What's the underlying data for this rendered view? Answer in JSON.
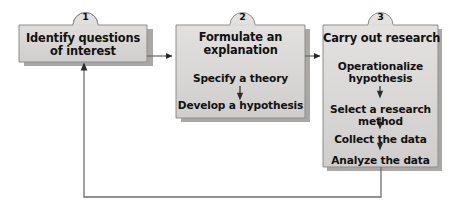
{
  "diagram": {
    "type": "flowchart",
    "orientation": "left-to-right with feedback loop",
    "colors": {
      "box_fill": "#d5d4d2",
      "box_fill_light": "#e2e1df",
      "box_border": "#8c8c8c",
      "shadow": "#a9a8a6",
      "connector": "#6f6f6f",
      "text": "#111111",
      "background": "#ffffff"
    },
    "boxes": [
      {
        "number": "1",
        "heading_lines": [
          "Identify questions",
          "of interest"
        ],
        "steps": []
      },
      {
        "number": "2",
        "heading_lines": [
          "Formulate an",
          "explanation"
        ],
        "steps": [
          {
            "lines": [
              "Specify a theory"
            ]
          },
          {
            "lines": [
              "Develop a hypothesis"
            ]
          }
        ]
      },
      {
        "number": "3",
        "heading_lines": [
          "Carry out research"
        ],
        "steps": [
          {
            "lines": [
              "Operationalize",
              "hypothesis"
            ]
          },
          {
            "lines": [
              "Select a research",
              "method"
            ]
          },
          {
            "lines": [
              "Collect the data"
            ]
          },
          {
            "lines": [
              "Analyze the data"
            ]
          }
        ]
      }
    ],
    "connectors": [
      {
        "name": "box1-to-box2",
        "kind": "arrow-right"
      },
      {
        "name": "box2-to-box3",
        "kind": "arrow-right"
      },
      {
        "name": "box3-to-box1-feedback",
        "kind": "arrow-loop-up"
      },
      {
        "name": "box2-internal-step-arrow",
        "kind": "arrow-down"
      },
      {
        "name": "box3-internal-step-arrow-1",
        "kind": "arrow-down"
      },
      {
        "name": "box3-internal-step-arrow-2",
        "kind": "arrow-down"
      },
      {
        "name": "box3-internal-step-arrow-3",
        "kind": "arrow-down"
      }
    ]
  }
}
